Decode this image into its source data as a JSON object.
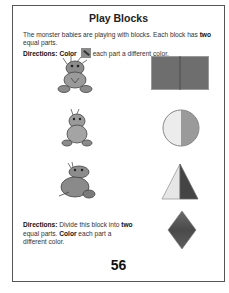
{
  "worksheet": {
    "title": "Play Blocks",
    "intro": {
      "text_before": "The monster babies are playing with blocks. Each block has ",
      "bold_word": "two",
      "text_after": " equal parts."
    },
    "directions1": {
      "label": "Directions:",
      "bold_verb": "Color",
      "icon": "crayon-icon",
      "text": "each part a different color."
    },
    "rows": [
      {
        "monster": "monster-baby-1",
        "shape": "rectangle",
        "parts": 2,
        "colors": [
          "#6e6e6e",
          "#6a6a6a"
        ]
      },
      {
        "monster": "monster-baby-2",
        "shape": "circle",
        "parts": 2,
        "colors": [
          "#ececec",
          "#9a9a9a"
        ]
      },
      {
        "monster": "monster-baby-3",
        "shape": "triangle",
        "parts": 2,
        "colors": [
          "#e6e6e6",
          "#444444"
        ]
      },
      {
        "monster": null,
        "shape": "diamond",
        "parts": 1,
        "colors": [
          "#5a5a5a"
        ]
      }
    ],
    "directions2": {
      "label": "Directions:",
      "text1": " Divide this block into ",
      "bold_two": "two",
      "text2": " equal parts. ",
      "bold_color": "Color",
      "text3": " each part a different color."
    },
    "page_number": "56"
  }
}
